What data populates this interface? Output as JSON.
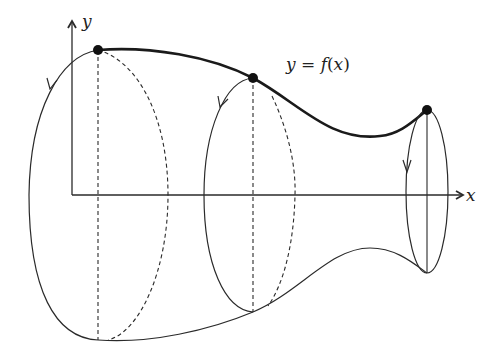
{
  "diagram": {
    "axes": {
      "x_label": "x",
      "y_label": "y"
    },
    "curve_label": "y = f(x)",
    "curve_label_parts": {
      "y": "y",
      "eq": " = ",
      "f": "f",
      "paren_open": "(",
      "x": "x",
      "paren_close": ")"
    },
    "marked_points": 3,
    "cross_sections": [
      {
        "name": "left-section",
        "style": "dashed",
        "direction_arrow": "down"
      },
      {
        "name": "middle-section",
        "style": "dashed",
        "direction_arrow": "down"
      },
      {
        "name": "right-section",
        "style": "solid",
        "direction_arrow": "down"
      }
    ],
    "colors": {
      "stroke": "#2a2a2a",
      "point": "#111111",
      "background": "#ffffff"
    }
  }
}
